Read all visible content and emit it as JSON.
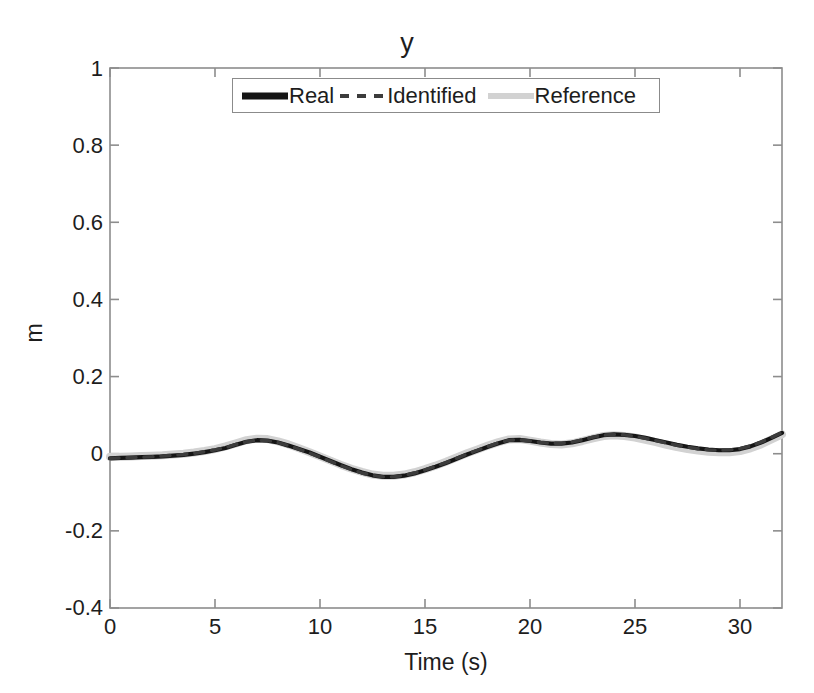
{
  "chart_data": {
    "type": "line",
    "title": "y",
    "xlabel": "Time (s)",
    "ylabel": "m",
    "xlim": [
      0,
      32
    ],
    "ylim": [
      -0.4,
      1
    ],
    "xticks": [
      0,
      5,
      10,
      15,
      20,
      25,
      30
    ],
    "xtick_labels": [
      "0",
      "5",
      "10",
      "15",
      "20",
      "25",
      "30"
    ],
    "yticks": [
      -0.4,
      -0.2,
      0,
      0.2,
      0.4,
      0.6,
      0.8,
      1
    ],
    "ytick_labels": [
      "-0.4",
      "-0.2",
      "0",
      "0.2",
      "0.4",
      "0.6",
      "0.8",
      "1"
    ],
    "grid": false,
    "legend_position": "north",
    "legend": [
      {
        "name": "Real",
        "color": "#151515",
        "style": "solid",
        "width": 7
      },
      {
        "name": "Identified",
        "color": "#3c3c3c",
        "style": "dashed",
        "width": 4
      },
      {
        "name": "Reference",
        "color": "#d2d2d2",
        "style": "solid",
        "width": 6
      }
    ],
    "x": [
      0,
      0.5,
      1,
      1.5,
      2,
      2.5,
      3,
      3.5,
      4,
      4.5,
      5,
      5.5,
      6,
      6.5,
      7,
      7.5,
      8,
      8.5,
      9,
      9.5,
      10,
      10.5,
      11,
      11.5,
      12,
      12.5,
      13,
      13.5,
      14,
      14.5,
      15,
      15.5,
      16,
      16.5,
      17,
      17.5,
      18,
      18.5,
      19,
      19.5,
      20,
      20.5,
      21,
      21.5,
      22,
      22.5,
      23,
      23.5,
      24,
      24.5,
      25,
      25.5,
      26,
      26.5,
      27,
      27.5,
      28,
      28.5,
      29,
      29.5,
      30,
      30.5,
      31,
      31.5,
      32
    ],
    "series": [
      {
        "name": "Real",
        "color": "#151515",
        "style": "solid",
        "values": [
          -0.012,
          -0.011,
          -0.01,
          -0.009,
          -0.008,
          -0.007,
          -0.005,
          -0.003,
          0.0,
          0.004,
          0.009,
          0.015,
          0.023,
          0.031,
          0.035,
          0.034,
          0.029,
          0.021,
          0.012,
          0.003,
          -0.008,
          -0.019,
          -0.03,
          -0.04,
          -0.049,
          -0.056,
          -0.06,
          -0.06,
          -0.057,
          -0.051,
          -0.043,
          -0.034,
          -0.024,
          -0.013,
          -0.002,
          0.008,
          0.018,
          0.027,
          0.035,
          0.036,
          0.033,
          0.029,
          0.026,
          0.026,
          0.029,
          0.035,
          0.042,
          0.048,
          0.05,
          0.049,
          0.046,
          0.041,
          0.035,
          0.029,
          0.023,
          0.018,
          0.014,
          0.011,
          0.009,
          0.009,
          0.012,
          0.019,
          0.029,
          0.041,
          0.054
        ]
      },
      {
        "name": "Identified",
        "color": "#3c3c3c",
        "style": "dashed",
        "values": [
          -0.012,
          -0.011,
          -0.01,
          -0.009,
          -0.008,
          -0.006,
          -0.004,
          -0.002,
          0.001,
          0.005,
          0.01,
          0.016,
          0.024,
          0.031,
          0.035,
          0.034,
          0.029,
          0.021,
          0.012,
          0.002,
          -0.009,
          -0.02,
          -0.031,
          -0.041,
          -0.05,
          -0.056,
          -0.06,
          -0.06,
          -0.056,
          -0.05,
          -0.042,
          -0.033,
          -0.023,
          -0.012,
          -0.001,
          0.009,
          0.019,
          0.028,
          0.035,
          0.036,
          0.033,
          0.029,
          0.027,
          0.027,
          0.03,
          0.036,
          0.043,
          0.048,
          0.05,
          0.049,
          0.045,
          0.04,
          0.034,
          0.028,
          0.022,
          0.017,
          0.013,
          0.01,
          0.009,
          0.01,
          0.013,
          0.02,
          0.03,
          0.042,
          0.055
        ]
      },
      {
        "name": "Reference",
        "color": "#d2d2d2",
        "style": "solid",
        "values": [
          -0.008,
          -0.008,
          -0.007,
          -0.006,
          -0.005,
          -0.004,
          -0.002,
          0.0,
          0.003,
          0.007,
          0.012,
          0.019,
          0.027,
          0.035,
          0.039,
          0.038,
          0.032,
          0.024,
          0.014,
          0.004,
          -0.007,
          -0.018,
          -0.029,
          -0.039,
          -0.047,
          -0.054,
          -0.057,
          -0.057,
          -0.054,
          -0.048,
          -0.04,
          -0.031,
          -0.021,
          -0.01,
          0.001,
          0.011,
          0.021,
          0.03,
          0.037,
          0.038,
          0.034,
          0.029,
          0.025,
          0.024,
          0.027,
          0.033,
          0.04,
          0.046,
          0.048,
          0.046,
          0.042,
          0.036,
          0.03,
          0.023,
          0.017,
          0.012,
          0.008,
          0.005,
          0.004,
          0.004,
          0.007,
          0.014,
          0.024,
          0.037,
          0.05
        ]
      }
    ]
  },
  "axes": {
    "title": "y",
    "xlabel": "Time (s)",
    "ylabel": "m"
  },
  "legend": {
    "real_label": "Real",
    "identified_label": "Identified",
    "reference_label": "Reference"
  },
  "ytick_labels": {
    "t0": "1",
    "t1": "0.8",
    "t2": "0.6",
    "t3": "0.4",
    "t4": "0.2",
    "t5": "0",
    "t6": "-0.2",
    "t7": "-0.4"
  },
  "xtick_labels": {
    "t0": "0",
    "t1": "5",
    "t2": "10",
    "t3": "15",
    "t4": "20",
    "t5": "25",
    "t6": "30"
  }
}
